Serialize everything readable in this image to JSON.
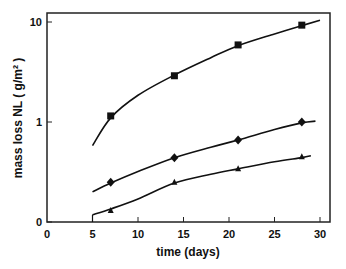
{
  "chart_data": {
    "type": "scatter",
    "title": "",
    "xlabel": "time  (days)",
    "ylabel": "mass loss  NL ( g/m² )",
    "x_ticks": [
      "0",
      "5",
      "10",
      "15",
      "20",
      "25",
      "30"
    ],
    "x_tick_values": [
      0,
      5,
      10,
      15,
      20,
      25,
      30
    ],
    "y_ticks": [
      "10",
      "1",
      "0"
    ],
    "y_tick_values": [
      10,
      1,
      0.1
    ],
    "xlim": [
      0,
      31
    ],
    "ylim": [
      0.1,
      12
    ],
    "yscale": "log",
    "grid": false,
    "legend": "none",
    "series": [
      {
        "name": "square",
        "marker": "square",
        "x": [
          7,
          14,
          21,
          28
        ],
        "y": [
          1.15,
          2.9,
          5.9,
          9.3
        ],
        "fit_curve": {
          "x": [
            5,
            7,
            10,
            14,
            18,
            21,
            25,
            28,
            30
          ],
          "y": [
            0.58,
            1.1,
            1.85,
            2.95,
            4.4,
            5.8,
            7.6,
            9.2,
            10.4
          ]
        }
      },
      {
        "name": "diamond",
        "marker": "diamond",
        "x": [
          7,
          14,
          21,
          28
        ],
        "y": [
          0.25,
          0.44,
          0.66,
          1.0
        ],
        "fit_curve": {
          "x": [
            5,
            7,
            10,
            14,
            18,
            21,
            25,
            28,
            29.5
          ],
          "y": [
            0.2,
            0.245,
            0.32,
            0.44,
            0.56,
            0.66,
            0.84,
            0.98,
            1.02
          ]
        }
      },
      {
        "name": "triangle",
        "marker": "triangle",
        "x": [
          7,
          14,
          21,
          28
        ],
        "y": [
          0.13,
          0.25,
          0.34,
          0.45
        ],
        "fit_curve": {
          "x": [
            5,
            7,
            10,
            14,
            18,
            21,
            25,
            28,
            29
          ],
          "y": [
            0.118,
            0.135,
            0.17,
            0.245,
            0.3,
            0.34,
            0.4,
            0.44,
            0.46
          ]
        }
      }
    ]
  }
}
